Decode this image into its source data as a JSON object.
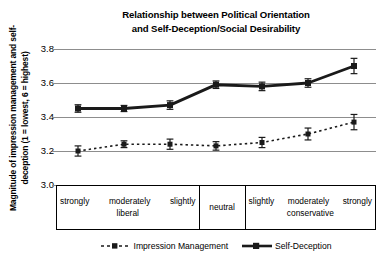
{
  "chart_data": {
    "type": "line",
    "title": "Relationship between Political Orientation and Self-Deception/Social Desirability",
    "title_lines": [
      "Relationship between Political Orientation",
      "and Self-Deception/Social Desirability"
    ],
    "ylabel": "Magnitude of impression management and self-deception (1 = lowest, 6 = highest)",
    "ylabel_lines": [
      "Magnitude of impression management and self-",
      "deception (1 = lowest, 6 = highest)"
    ],
    "xlabel": "",
    "ylim": [
      3.0,
      3.8
    ],
    "yticks": [
      "3.8",
      "3.6",
      "3.4",
      "3.2",
      "3.0"
    ],
    "ytick_values": [
      3.8,
      3.6,
      3.4,
      3.2,
      3.0
    ],
    "grid": true,
    "legend_position": "bottom",
    "categories": [
      "strongly liberal",
      "moderately liberal",
      "slightly liberal",
      "neutral",
      "slightly conservative",
      "moderately conservative",
      "strongly conservative"
    ],
    "x_groups": [
      {
        "name": "liberal-group",
        "items": [
          "strongly",
          "moderately",
          "slightly"
        ],
        "label": "liberal"
      },
      {
        "name": "neutral-group",
        "items": [],
        "label": "neutral"
      },
      {
        "name": "conservative-group",
        "items": [
          "slightly",
          "moderately",
          "strongly"
        ],
        "label": "conservative"
      }
    ],
    "series": [
      {
        "name": "Impression Management",
        "style": "dashed",
        "marker": "square",
        "color": "#1a1a1a",
        "values": [
          3.2,
          3.24,
          3.24,
          3.23,
          3.25,
          3.3,
          3.37
        ],
        "errors": [
          0.03,
          0.02,
          0.03,
          0.025,
          0.03,
          0.035,
          0.045
        ]
      },
      {
        "name": "Self-Deception",
        "style": "solid",
        "marker": "square",
        "color": "#1a1a1a",
        "values": [
          3.45,
          3.45,
          3.47,
          3.59,
          3.58,
          3.6,
          3.7
        ],
        "errors": [
          0.022,
          0.018,
          0.025,
          0.022,
          0.025,
          0.025,
          0.045
        ]
      }
    ]
  },
  "legend": {
    "items": [
      {
        "label": "Impression Management",
        "style": "dashed"
      },
      {
        "label": "Self-Deception",
        "style": "solid"
      }
    ]
  }
}
